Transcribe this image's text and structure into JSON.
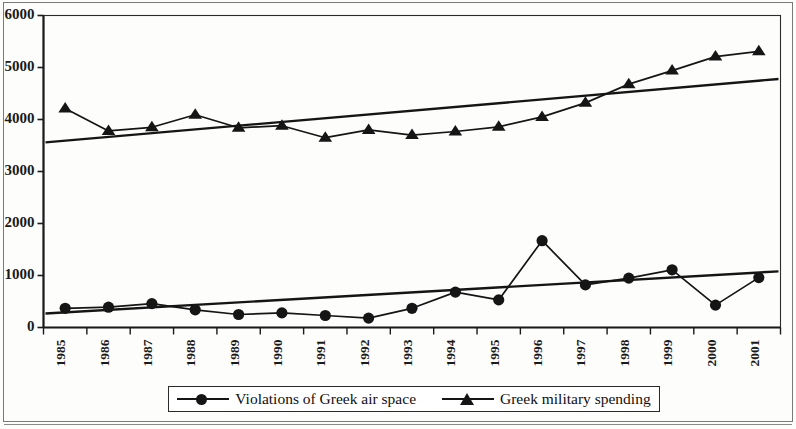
{
  "chart_data": {
    "type": "line",
    "title": "",
    "subtitle": "",
    "xlabel": "",
    "ylabel": "",
    "categories": [
      "1985",
      "1986",
      "1987",
      "1988",
      "1989",
      "1990",
      "1991",
      "1992",
      "1993",
      "1994",
      "1995",
      "1996",
      "1997",
      "1998",
      "1999",
      "2000",
      "2001"
    ],
    "ylim": [
      0,
      6000
    ],
    "yticks": [
      0,
      1000,
      2000,
      3000,
      4000,
      5000,
      6000
    ],
    "ytick_labels": [
      "0",
      "1000",
      "2000",
      "3000",
      "4000",
      "5000",
      "6000"
    ],
    "grid": false,
    "legend_position": "bottom",
    "series": [
      {
        "name": "Violations of Greek air space",
        "marker": "circle",
        "color": "#151515",
        "values": [
          370,
          390,
          460,
          340,
          250,
          280,
          230,
          180,
          370,
          680,
          530,
          1670,
          820,
          950,
          1110,
          430,
          960
        ],
        "trendline": {
          "start": 270,
          "end": 1080
        }
      },
      {
        "name": "Greek military spending",
        "marker": "triangle",
        "color": "#151515",
        "values": [
          4210,
          3780,
          3850,
          4090,
          3840,
          3880,
          3650,
          3800,
          3700,
          3770,
          3860,
          4050,
          4320,
          4680,
          4940,
          5210,
          5310
        ],
        "trendline": {
          "start": 3560,
          "end": 4780
        }
      }
    ]
  },
  "legend": {
    "entries": [
      {
        "label": "Violations of Greek air space",
        "marker": "circle"
      },
      {
        "label": "Greek military spending",
        "marker": "triangle"
      }
    ]
  },
  "axes": {
    "y_tick_labels": [
      "6000",
      "5000",
      "4000",
      "3000",
      "2000",
      "1000",
      "0"
    ],
    "x_tick_labels": [
      "1985",
      "1986",
      "1987",
      "1988",
      "1989",
      "1990",
      "1991",
      "1992",
      "1993",
      "1994",
      "1995",
      "1996",
      "1997",
      "1998",
      "1999",
      "2000",
      "2001"
    ]
  }
}
